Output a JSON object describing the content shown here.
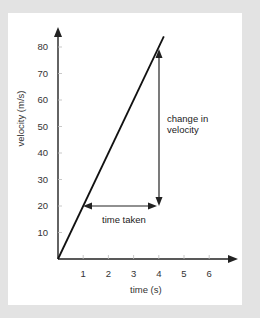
{
  "chart_data": {
    "type": "line",
    "title": "",
    "xlabel": "time (s)",
    "ylabel": "velocity (m/s)",
    "x_ticks": [
      "1",
      "2",
      "3",
      "4",
      "5",
      "6"
    ],
    "y_ticks": [
      "10",
      "20",
      "30",
      "40",
      "50",
      "60",
      "70",
      "80"
    ],
    "xlim": [
      0,
      7
    ],
    "ylim": [
      0,
      85
    ],
    "grid": false,
    "series": [
      {
        "name": "velocity",
        "x": [
          0,
          1,
          2,
          3,
          4,
          4.2
        ],
        "y": [
          0,
          20,
          40,
          60,
          80,
          84
        ]
      }
    ],
    "annotations": [
      {
        "type": "double-arrow-horizontal",
        "label": "time taken",
        "x_from": 1,
        "x_to": 4,
        "y": 20
      },
      {
        "type": "double-arrow-vertical",
        "label_lines": [
          "change in",
          "velocity"
        ],
        "x": 4,
        "y_from": 20,
        "y_to": 80
      }
    ]
  },
  "labels": {
    "xlabel": "time (s)",
    "ylabel": "velocity (m/s)",
    "time_taken": "time taken",
    "change_line1": "change in",
    "change_line2": "velocity"
  },
  "colors": {
    "background": "#e3e3e3",
    "panel": "#ffffff",
    "line": "#111111",
    "axis": "#222222",
    "text": "#333333"
  }
}
